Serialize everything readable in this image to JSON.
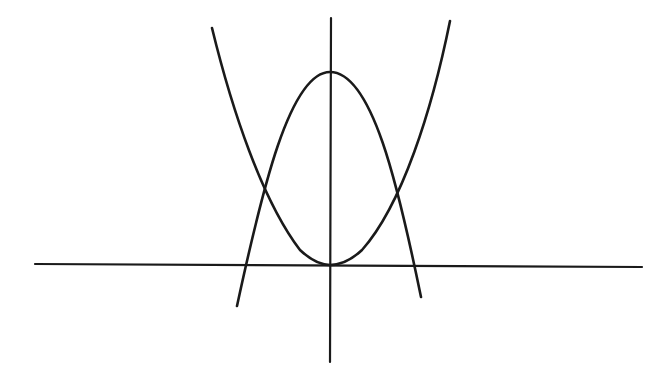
{
  "diagram": {
    "stroke_color": "#1a1a1a",
    "background": "#ffffff",
    "x_axis": {
      "x1": 35,
      "y1": 264,
      "x2": 642,
      "y2": 267
    },
    "y_axis": {
      "x1": 331,
      "y1": 18,
      "x2": 330,
      "y2": 362
    },
    "upward_parabola": {
      "vertex": [
        330,
        265
      ],
      "left_end": [
        212,
        28
      ],
      "right_end": [
        450,
        21
      ],
      "path": "M212,28 C232,110 262,200 300,250 Q316,265 330,265 Q346,265 362,250 C402,205 432,110 450,21"
    },
    "downward_parabola": {
      "vertex": [
        330,
        72
      ],
      "left_end": [
        237,
        306
      ],
      "right_end": [
        421,
        297
      ],
      "x_intercepts": [
        246,
        414
      ],
      "path": "M237,306 C262,190 290,72 330,72 C372,72 398,185 421,297"
    },
    "intersections": [
      [
        262,
        206
      ],
      [
        399,
        204
      ]
    ],
    "labels": []
  }
}
